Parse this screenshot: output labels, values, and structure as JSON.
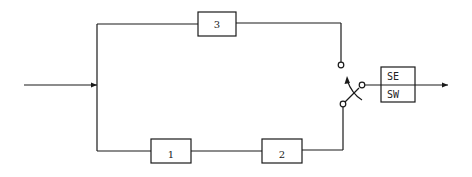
{
  "diagram": {
    "type": "block-diagram",
    "colors": {
      "stroke": "#1a1a1a",
      "background": "#ffffff"
    },
    "blocks": [
      {
        "id": "block-3",
        "label": "3"
      },
      {
        "id": "block-1",
        "label": "1"
      },
      {
        "id": "block-2",
        "label": "2"
      }
    ],
    "output_block": {
      "top_label": "SE",
      "bottom_label": "SW"
    },
    "switch": {
      "name": "changeover-switch"
    }
  }
}
